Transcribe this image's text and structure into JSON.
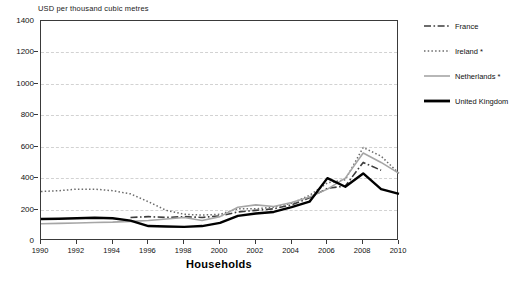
{
  "chart_data": {
    "type": "line",
    "title": "",
    "ylabel": "USD per thousand cubic metres",
    "xlabel": "Households",
    "ylim": [
      0,
      1400
    ],
    "xlim": [
      1990,
      2010
    ],
    "yticks": [
      0,
      200,
      400,
      600,
      800,
      1000,
      1200,
      1400
    ],
    "xticks": [
      1990,
      1992,
      1994,
      1996,
      1998,
      2000,
      2002,
      2004,
      2006,
      2008,
      2010
    ],
    "grid": true,
    "legend_position": "right",
    "x": [
      1990,
      1991,
      1992,
      1993,
      1994,
      1995,
      1996,
      1997,
      1998,
      1999,
      2000,
      2001,
      2002,
      2003,
      2004,
      2005,
      2006,
      2007,
      2008,
      2009,
      2010
    ],
    "series": [
      {
        "name": "France",
        "style": "dash-dot",
        "color": "#3d3d3d",
        "values": [
          null,
          null,
          null,
          null,
          null,
          150,
          155,
          150,
          155,
          150,
          160,
          185,
          195,
          205,
          230,
          275,
          335,
          350,
          500,
          450,
          null
        ]
      },
      {
        "name": "Ireland *",
        "style": "dotted",
        "color": "#6b6b6b",
        "values": [
          315,
          320,
          330,
          330,
          320,
          300,
          250,
          195,
          170,
          165,
          170,
          205,
          205,
          215,
          240,
          290,
          370,
          390,
          595,
          540,
          430
        ]
      },
      {
        "name": "Netherlands *",
        "style": "solid-light",
        "color": "#a6a6a6",
        "values": [
          110,
          112,
          115,
          118,
          120,
          125,
          130,
          140,
          150,
          130,
          155,
          215,
          230,
          220,
          245,
          280,
          330,
          400,
          560,
          500,
          430
        ]
      },
      {
        "name": "United Kingdom",
        "style": "solid-bold",
        "color": "#000000",
        "values": [
          140,
          142,
          145,
          148,
          145,
          130,
          95,
          92,
          90,
          95,
          115,
          160,
          175,
          185,
          215,
          250,
          400,
          345,
          430,
          330,
          300
        ]
      }
    ]
  },
  "legend": {
    "items": [
      {
        "label": "France"
      },
      {
        "label": "Ireland *"
      },
      {
        "label": "Netherlands *"
      },
      {
        "label": "United Kingdom"
      }
    ]
  }
}
